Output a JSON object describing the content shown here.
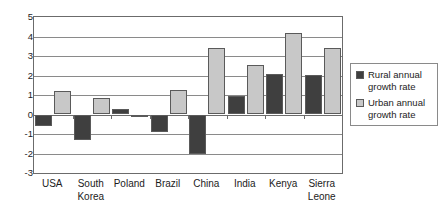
{
  "chart_data": {
    "type": "bar",
    "title": "",
    "subtitle": "",
    "xlabel": "",
    "ylabel": "",
    "ylim": [
      -3,
      5
    ],
    "yticks": [
      5,
      4,
      3,
      2,
      1,
      0,
      -1,
      -2,
      -3
    ],
    "ytick_labels": [
      "5",
      "4",
      "3",
      "2",
      "1",
      "0",
      "-1",
      "-2",
      "-3"
    ],
    "grid": true,
    "legend_position": "right",
    "categories": [
      "USA",
      "South Korea",
      "Poland",
      "Brazil",
      "China",
      "India",
      "Kenya",
      "Sierra Leone"
    ],
    "category_lines": [
      [
        "USA"
      ],
      [
        "South",
        "Korea"
      ],
      [
        "Poland"
      ],
      [
        "Brazil"
      ],
      [
        "China"
      ],
      [
        "India"
      ],
      [
        "Kenya"
      ],
      [
        "Sierra",
        "Leone"
      ]
    ],
    "series": [
      {
        "name": "Rural annual growth rate",
        "color": "#3f3f3f",
        "values": [
          -0.6,
          -1.3,
          0.28,
          -0.9,
          -2.05,
          0.95,
          2.1,
          2.05
        ]
      },
      {
        "name": "Urban annual growth rate",
        "color": "#c8c8c8",
        "values": [
          1.2,
          0.85,
          -0.1,
          1.27,
          3.4,
          2.55,
          4.2,
          3.4
        ]
      }
    ]
  },
  "legend": {
    "entries": [
      {
        "label_line1": "Rural annual",
        "label_line2": "growth rate"
      },
      {
        "label_line1": "Urban annual",
        "label_line2": "growth rate"
      }
    ]
  },
  "colors": {
    "rural": "#3f3f3f",
    "urban": "#c8c8c8",
    "axis": "#6b6b6b",
    "grid": "#8a8a8a",
    "background": "#ffffff",
    "text": "#1c1c1c"
  }
}
